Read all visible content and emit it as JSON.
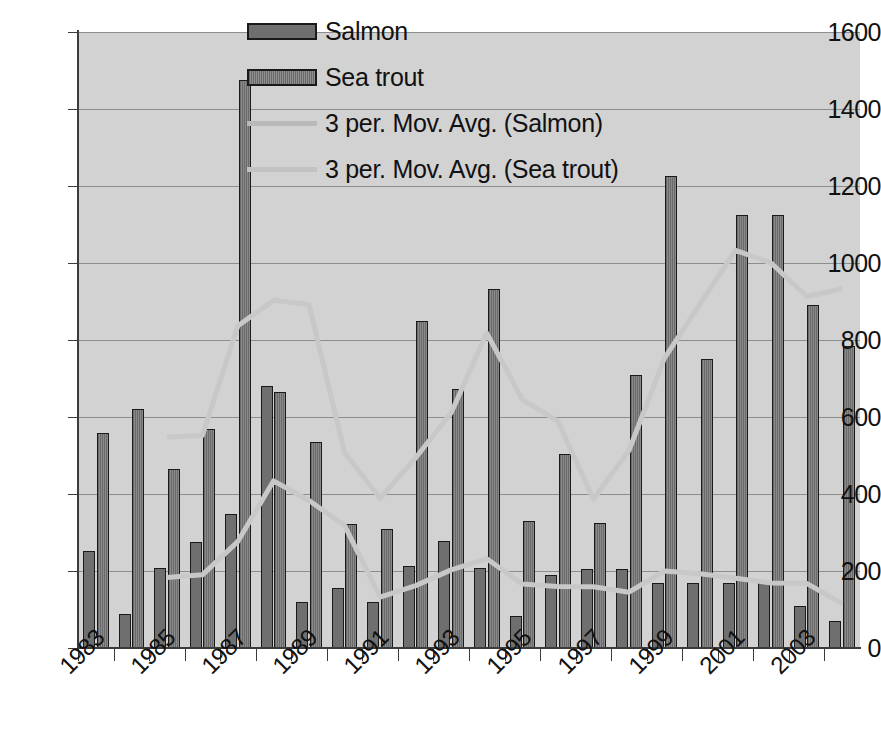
{
  "chart_data": {
    "type": "bar",
    "title": "",
    "xlabel": "",
    "ylabel": "",
    "ylim": [
      0,
      1600
    ],
    "ytick_step": 200,
    "yticks": [
      0,
      200,
      400,
      600,
      800,
      1000,
      1200,
      1400,
      1600
    ],
    "grid": true,
    "legend_position": "top-center",
    "categories": [
      "1983",
      "1984",
      "1985",
      "1986",
      "1987",
      "1988",
      "1989",
      "1990",
      "1991",
      "1992",
      "1993",
      "1994",
      "1995",
      "1996",
      "1997",
      "1998",
      "1999",
      "2000",
      "2001",
      "2002",
      "2003",
      "2004"
    ],
    "xtick_labels_shown": [
      "1983",
      "1985",
      "1987",
      "1989",
      "1991",
      "1993",
      "1995",
      "1997",
      "1999",
      "2001",
      "2003"
    ],
    "series": [
      {
        "name": "Salmon",
        "kind": "bar",
        "color": "#6f6f6f",
        "values": [
          253,
          88,
          207,
          275,
          348,
          680,
          120,
          155,
          120,
          212,
          277,
          207,
          83,
          190,
          205,
          205,
          168,
          170,
          168,
          168,
          108,
          70
        ]
      },
      {
        "name": "Sea trout",
        "kind": "bar",
        "color": "#787878",
        "values": [
          558,
          622,
          465,
          570,
          1475,
          665,
          535,
          322,
          310,
          850,
          672,
          933,
          330,
          505,
          325,
          708,
          1225,
          750,
          1125,
          1125,
          890,
          785
        ]
      },
      {
        "name": "3 per. Mov. Avg. (Salmon)",
        "kind": "line",
        "color": "#c8c8c8",
        "start_index": 2,
        "values": [
          null,
          null,
          183,
          190,
          277,
          434,
          383,
          318,
          132,
          162,
          203,
          232,
          166,
          160,
          159,
          145,
          200,
          193,
          181,
          169,
          168,
          115
        ]
      },
      {
        "name": "3 per. Mov. Avg. (Sea trout)",
        "kind": "line",
        "color": "#c8c8c8",
        "start_index": 2,
        "values": [
          null,
          null,
          548,
          552,
          837,
          903,
          892,
          507,
          389,
          494,
          611,
          818,
          645,
          589,
          387,
          513,
          753,
          894,
          1033,
          1000,
          913,
          933
        ]
      }
    ]
  },
  "legend": {
    "items": [
      {
        "label": "Salmon",
        "marker": "bar-swatch-salmon"
      },
      {
        "label": "Sea trout",
        "marker": "bar-swatch-seatrout"
      },
      {
        "label": "3 per. Mov. Avg. (Salmon)",
        "marker": "line-swatch-salmon-avg"
      },
      {
        "label": "3 per. Mov. Avg. (Sea trout)",
        "marker": "line-swatch-seatrout-avg"
      }
    ]
  },
  "colors": {
    "plot_background": "#d2d2d2",
    "page_background": "#ffffff",
    "axis": "#3b3b3b",
    "gridline": "#8d8d8d",
    "bar_outline": "#1a1a1a",
    "salmon_bar": "#6f6f6f",
    "seatrout_bar": "#787878",
    "moving_average_line": "#c8c8c8",
    "text": "#111111"
  }
}
